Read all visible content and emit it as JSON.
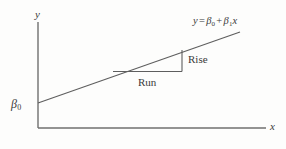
{
  "figure": {
    "type": "line-diagram",
    "background_color": "#fdfdfc",
    "stroke_color": "#6a6a6a",
    "text_color": "#3a3a3a"
  },
  "axes": {
    "y_label": "y",
    "x_label": "x",
    "origin": {
      "x": 38,
      "y": 128
    },
    "y_axis_top": {
      "x": 38,
      "y": 22
    },
    "x_axis_right": {
      "x": 266,
      "y": 128
    }
  },
  "intercept": {
    "symbol": "β",
    "subscript": "0"
  },
  "equation": {
    "lhs": "y",
    "equals": "=",
    "beta": "β",
    "sub0": "0",
    "plus": "+",
    "sub1": "1",
    "x_var": "x",
    "full_text": "y = β0 + β1x"
  },
  "slope_triangle": {
    "rise_label": "Rise",
    "run_label": "Run",
    "left_vertex": {
      "x": 113,
      "y": 71
    },
    "right_vertex": {
      "x": 182,
      "y": 71
    },
    "top_vertex": {
      "x": 182,
      "y": 50
    }
  },
  "regression_line": {
    "start": {
      "x": 38,
      "y": 103
    },
    "end": {
      "x": 240,
      "y": 32
    }
  }
}
